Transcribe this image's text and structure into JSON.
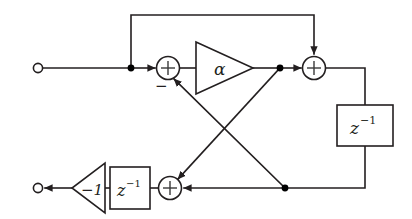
{
  "diagram": {
    "type": "signal-flow-block-diagram",
    "colors": {
      "line": "#231f20",
      "background": "#ffffff",
      "node": "#000000"
    },
    "terminals": [
      {
        "name": "input-terminal",
        "x": 38,
        "y": 68,
        "label": ""
      },
      {
        "name": "output-terminal",
        "x": 38,
        "y": 188,
        "label": ""
      }
    ],
    "adders": [
      {
        "name": "adder-left",
        "x": 168,
        "y": 68,
        "symbol": "+",
        "sign_label": "−"
      },
      {
        "name": "adder-right",
        "x": 314,
        "y": 68,
        "symbol": "+",
        "sign_label": ""
      },
      {
        "name": "adder-bottom",
        "x": 170,
        "y": 188,
        "symbol": "+",
        "sign_label": ""
      }
    ],
    "gains": [
      {
        "name": "gain-alpha",
        "label": "α",
        "direction": "right",
        "x": 210,
        "y": 68
      },
      {
        "name": "gain-minus-one",
        "label": "−1",
        "direction": "left",
        "x": 72,
        "y": 188
      }
    ],
    "delays": [
      {
        "name": "delay-right",
        "base": "z",
        "exponent": "−1",
        "x": 365,
        "y": 125
      },
      {
        "name": "delay-bottom",
        "base": "z",
        "exponent": "−1",
        "x": 130,
        "y": 188
      }
    ],
    "junctions": [
      {
        "name": "junction-input-split",
        "x": 131,
        "y": 68
      },
      {
        "name": "junction-alpha-out",
        "x": 280,
        "y": 68
      },
      {
        "name": "junction-bottom-rail",
        "x": 285,
        "y": 188
      }
    ],
    "paths": [
      {
        "name": "path-input-to-split",
        "from": "input-terminal",
        "to": "junction-input-split"
      },
      {
        "name": "path-feedforward-top",
        "from": "junction-input-split",
        "to": "adder-right"
      },
      {
        "name": "path-split-to-adder-left",
        "from": "junction-input-split",
        "to": "adder-left"
      },
      {
        "name": "path-adder-left-to-alpha",
        "from": "adder-left",
        "to": "gain-alpha"
      },
      {
        "name": "path-alpha-to-junction",
        "from": "gain-alpha",
        "to": "junction-alpha-out"
      },
      {
        "name": "path-junction-to-adder-right",
        "from": "junction-alpha-out",
        "to": "adder-right"
      },
      {
        "name": "path-adder-right-to-delay",
        "from": "adder-right",
        "to": "delay-right"
      },
      {
        "name": "path-delay-to-bottom-rail",
        "from": "delay-right",
        "to": "junction-bottom-rail"
      },
      {
        "name": "path-bottom-rail-to-adder-bottom",
        "from": "junction-bottom-rail",
        "to": "adder-bottom"
      },
      {
        "name": "path-diagonal-feedback-up",
        "from": "junction-bottom-rail",
        "to": "adder-left"
      },
      {
        "name": "path-diagonal-feedback-down",
        "from": "junction-alpha-out",
        "to": "adder-bottom"
      },
      {
        "name": "path-adder-bottom-to-delay",
        "from": "adder-bottom",
        "to": "delay-bottom"
      },
      {
        "name": "path-delay-to-gain-minus-one",
        "from": "delay-bottom",
        "to": "gain-minus-one"
      },
      {
        "name": "path-gain-to-output",
        "from": "gain-minus-one",
        "to": "output-terminal"
      }
    ]
  }
}
